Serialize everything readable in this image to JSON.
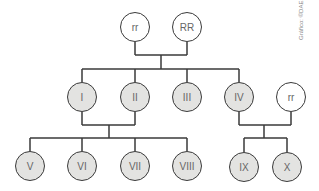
{
  "diagram": {
    "type": "pedigree",
    "credit": "Gráfico: ©DAE",
    "colors": {
      "line": "#3a3a3a",
      "affected_fill": "#e3e3e1",
      "normal_fill": "#ffffff",
      "text": "#666666"
    },
    "generation1": [
      {
        "label": "rr",
        "fill": "normal"
      },
      {
        "label": "RR",
        "fill": "normal"
      }
    ],
    "generation2": [
      {
        "label": "I",
        "fill": "affected"
      },
      {
        "label": "II",
        "fill": "affected"
      },
      {
        "label": "III",
        "fill": "affected"
      },
      {
        "label": "IV",
        "fill": "affected"
      },
      {
        "label": "rr",
        "fill": "normal"
      }
    ],
    "generation3": [
      {
        "label": "V",
        "fill": "affected"
      },
      {
        "label": "VI",
        "fill": "affected"
      },
      {
        "label": "VII",
        "fill": "affected"
      },
      {
        "label": "VIII",
        "fill": "affected"
      },
      {
        "label": "IX",
        "fill": "affected"
      },
      {
        "label": "X",
        "fill": "affected"
      }
    ]
  }
}
